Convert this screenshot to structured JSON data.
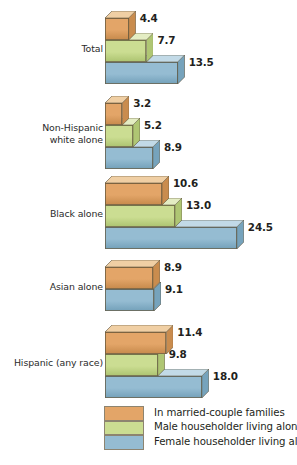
{
  "chart_data": {
    "type": "bar",
    "title": "",
    "subtitle": "",
    "xlabel": "",
    "ylabel": "",
    "orientation": "horizontal",
    "style": "3d-isometric-horizontal-bar",
    "grid": false,
    "legend_position": "bottom",
    "xlim": [
      0,
      24.5
    ],
    "categories": [
      "Total",
      "Non-Hispanic\nwhite alone",
      "Black alone",
      "Asian alone",
      "Hispanic (any race)"
    ],
    "series": [
      {
        "name": "In married-couple families",
        "color": "#E3A568",
        "top_color": "#F0CFA4",
        "side_color": "#C98C4E",
        "values": [
          4.4,
          3.2,
          10.6,
          8.9,
          11.4
        ]
      },
      {
        "name": "Male householder living alone",
        "color": "#CBDD92",
        "top_color": "#E4EDC3",
        "side_color": "#AFC673",
        "values": [
          7.7,
          5.2,
          13.0,
          null,
          9.8
        ]
      },
      {
        "name": "Female householder living alone",
        "color": "#95BCD2",
        "top_color": "#C2DAE7",
        "side_color": "#76A3BC",
        "values": [
          13.5,
          8.9,
          24.5,
          9.1,
          18.0
        ]
      }
    ],
    "value_labels": [
      [
        "4.4",
        "7.7",
        "13.5"
      ],
      [
        "3.2",
        "5.2",
        "8.9"
      ],
      [
        "10.6",
        "13.0",
        "24.5"
      ],
      [
        "8.9",
        "9.1"
      ],
      [
        "11.4",
        "9.8",
        "18.0"
      ]
    ]
  },
  "legend": {
    "items": [
      {
        "label": "In married-couple families",
        "color": "#E3A568"
      },
      {
        "label": "Male householder living alone",
        "color": "#CBDD92"
      },
      {
        "label": "Female householder living alone",
        "color": "#95BCD2"
      }
    ]
  },
  "caption": {
    "text": ""
  }
}
